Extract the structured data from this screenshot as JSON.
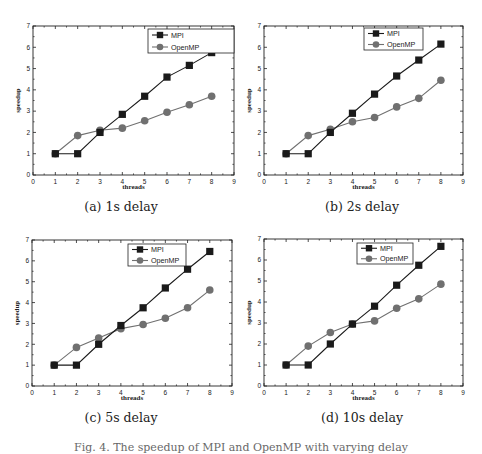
{
  "figure_caption": "Fig. 4. The speedup of MPI and OpenMP with varying delay",
  "colors": {
    "mpi": "#1a1a1a",
    "openmp": "#707070",
    "axis": "#222222",
    "legend_border": "#222222"
  },
  "chart_data": [
    {
      "id": "a",
      "type": "line",
      "caption": "(a) 1s delay",
      "xlabel": "threads",
      "ylabel": "speedup",
      "xlim": [
        0,
        9
      ],
      "ylim": [
        0,
        7
      ],
      "xticks": [
        0,
        1,
        2,
        3,
        4,
        5,
        6,
        7,
        8,
        9
      ],
      "yticks": [
        0,
        1,
        2,
        3,
        4,
        5,
        6,
        7
      ],
      "grid": false,
      "legend_position": "upper right",
      "x": [
        1,
        2,
        3,
        4,
        5,
        6,
        7,
        8
      ],
      "series": [
        {
          "name": "MPI",
          "marker": "square",
          "values": [
            1,
            1,
            2,
            2.85,
            3.7,
            4.6,
            5.15,
            5.75
          ]
        },
        {
          "name": "OpenMP",
          "marker": "circle",
          "values": [
            1,
            1.85,
            2.1,
            2.2,
            2.55,
            2.95,
            3.3,
            3.7
          ]
        }
      ]
    },
    {
      "id": "b",
      "type": "line",
      "caption": "(b) 2s delay",
      "xlabel": "threads",
      "ylabel": "speedup",
      "xlim": [
        0,
        9
      ],
      "ylim": [
        0,
        7
      ],
      "xticks": [
        0,
        1,
        2,
        3,
        4,
        5,
        6,
        7,
        8,
        9
      ],
      "yticks": [
        0,
        1,
        2,
        3,
        4,
        5,
        6,
        7
      ],
      "grid": false,
      "legend_position": "upper right",
      "x": [
        1,
        2,
        3,
        4,
        5,
        6,
        7,
        8
      ],
      "series": [
        {
          "name": "MPI",
          "marker": "square",
          "values": [
            1,
            1,
            2,
            2.9,
            3.8,
            4.65,
            5.4,
            6.15
          ]
        },
        {
          "name": "OpenMP",
          "marker": "circle",
          "values": [
            1,
            1.85,
            2.15,
            2.5,
            2.7,
            3.2,
            3.6,
            4.45
          ]
        }
      ]
    },
    {
      "id": "c",
      "type": "line",
      "caption": "(c) 5s delay",
      "xlabel": "threads",
      "ylabel": "speedup",
      "xlim": [
        0,
        9
      ],
      "ylim": [
        0,
        7
      ],
      "xticks": [
        0,
        1,
        2,
        3,
        4,
        5,
        6,
        7,
        8,
        9
      ],
      "yticks": [
        0,
        1,
        2,
        3,
        4,
        5,
        6,
        7
      ],
      "grid": false,
      "legend_position": "upper right",
      "x": [
        1,
        2,
        3,
        4,
        5,
        6,
        7,
        8
      ],
      "series": [
        {
          "name": "MPI",
          "marker": "square",
          "values": [
            1,
            1,
            2,
            2.9,
            3.75,
            4.7,
            5.6,
            6.45
          ]
        },
        {
          "name": "OpenMP",
          "marker": "circle",
          "values": [
            1,
            1.85,
            2.3,
            2.75,
            2.95,
            3.25,
            3.75,
            4.6
          ]
        }
      ]
    },
    {
      "id": "d",
      "type": "line",
      "caption": "(d) 10s delay",
      "xlabel": "threads",
      "ylabel": "speedup",
      "xlim": [
        0,
        9
      ],
      "ylim": [
        0,
        7
      ],
      "xticks": [
        0,
        1,
        2,
        3,
        4,
        5,
        6,
        7,
        8,
        9
      ],
      "yticks": [
        0,
        1,
        2,
        3,
        4,
        5,
        6,
        7
      ],
      "grid": false,
      "legend_position": "upper right",
      "x": [
        1,
        2,
        3,
        4,
        5,
        6,
        7,
        8
      ],
      "series": [
        {
          "name": "MPI",
          "marker": "square",
          "values": [
            1,
            1,
            2,
            2.95,
            3.8,
            4.8,
            5.75,
            6.65
          ]
        },
        {
          "name": "OpenMP",
          "marker": "circle",
          "values": [
            1,
            1.9,
            2.55,
            2.95,
            3.1,
            3.7,
            4.15,
            4.85
          ]
        }
      ]
    }
  ]
}
